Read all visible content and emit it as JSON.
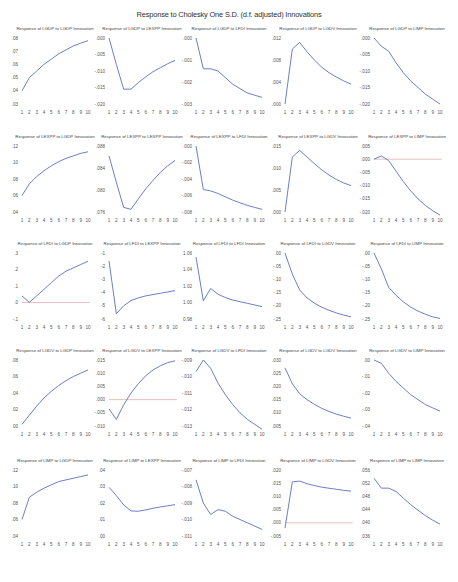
{
  "title": "Response to Cholesky One S.D. (d.f. adjusted) Innovations",
  "chart_data": [
    {
      "type": "line",
      "title": "Response of LGDP to LGDP Innovation",
      "x": [
        1,
        2,
        3,
        4,
        5,
        6,
        7,
        8,
        9,
        10
      ],
      "values": [
        0.04,
        0.05,
        0.055,
        0.06,
        0.064,
        0.068,
        0.071,
        0.074,
        0.076,
        0.078
      ],
      "yticks": [
        ".03",
        ".04",
        ".05",
        ".06",
        ".07",
        ".08"
      ],
      "ylim": [
        0.03,
        0.08
      ],
      "zero_line": false
    },
    {
      "type": "line",
      "title": "Response of LGDP to LEXPP Innovation",
      "x": [
        1,
        2,
        3,
        4,
        5,
        6,
        7,
        8,
        9,
        10
      ],
      "values": [
        0.0,
        -0.008,
        -0.0155,
        -0.0155,
        -0.0135,
        -0.0118,
        -0.0102,
        -0.009,
        -0.0078,
        -0.0068
      ],
      "yticks": [
        ".000",
        "-.005",
        "-.010",
        "-.015",
        "-.020"
      ],
      "ylim": [
        -0.02,
        0.0
      ],
      "zero_line": false
    },
    {
      "type": "line",
      "title": "Response of LGDP to LFDI Innovation",
      "x": [
        1,
        2,
        3,
        4,
        5,
        6,
        7,
        8,
        9,
        10
      ],
      "values": [
        0.0,
        -0.0014,
        -0.0014,
        -0.0015,
        -0.0018,
        -0.0021,
        -0.0023,
        -0.0025,
        -0.0026,
        -0.0027
      ],
      "yticks": [
        ".000",
        "-.001",
        "-.002",
        "-.003"
      ],
      "ylim": [
        -0.003,
        0.0
      ],
      "zero_line": false
    },
    {
      "type": "line",
      "title": "Response of LGDP to LGDV Innovation",
      "x": [
        1,
        2,
        3,
        4,
        5,
        6,
        7,
        8,
        9,
        10
      ],
      "values": [
        0.0,
        0.01,
        0.0112,
        0.0095,
        0.008,
        0.0067,
        0.0057,
        0.0049,
        0.0042,
        0.0036
      ],
      "yticks": [
        ".012",
        ".008",
        ".004",
        ".000"
      ],
      "ylim": [
        0.0,
        0.012
      ],
      "zero_line": false
    },
    {
      "type": "line",
      "title": "Response of LGDP to LIMP Innovation",
      "x": [
        1,
        2,
        3,
        4,
        5,
        6,
        7,
        8,
        9,
        10
      ],
      "values": [
        0.0,
        -0.0025,
        -0.004,
        -0.0075,
        -0.0105,
        -0.013,
        -0.015,
        -0.017,
        -0.0185,
        -0.02
      ],
      "yticks": [
        ".000",
        "-.005",
        "-.010",
        "-.015",
        "-.020"
      ],
      "ylim": [
        -0.02,
        0.0
      ],
      "zero_line": false
    },
    {
      "type": "line",
      "title": "Response of LEXPP to LGDP Innovation",
      "x": [
        1,
        2,
        3,
        4,
        5,
        6,
        7,
        8,
        9,
        10
      ],
      "values": [
        0.06,
        0.074,
        0.083,
        0.09,
        0.096,
        0.101,
        0.105,
        0.108,
        0.111,
        0.113
      ],
      "yticks": [
        ".12",
        ".10",
        ".08",
        ".06",
        ".04"
      ],
      "ylim": [
        0.04,
        0.12
      ],
      "zero_line": false
    },
    {
      "type": "line",
      "title": "Response of LEXPP to LEXPP Innovation",
      "x": [
        1,
        2,
        3,
        4,
        5,
        6,
        7,
        8,
        9,
        10
      ],
      "values": [
        0.0865,
        0.0825,
        0.0787,
        0.0784,
        0.08,
        0.0815,
        0.0828,
        0.084,
        0.085,
        0.0858
      ],
      "yticks": [
        ".088",
        ".084",
        ".080",
        ".076"
      ],
      "ylim": [
        0.078,
        0.088
      ],
      "zero_line": false
    },
    {
      "type": "line",
      "title": "Response of LEXPP to LFDI Innovation",
      "x": [
        1,
        2,
        3,
        4,
        5,
        6,
        7,
        8,
        9,
        10
      ],
      "values": [
        0.0,
        -0.0066,
        -0.0068,
        -0.0072,
        -0.0077,
        -0.0082,
        -0.0086,
        -0.009,
        -0.0093,
        -0.0096
      ],
      "yticks": [
        ".000",
        "-.002",
        "-.004",
        "-.006",
        "-.008"
      ],
      "ylim": [
        -0.01,
        0.0
      ],
      "zero_line": false
    },
    {
      "type": "line",
      "title": "Response of LEXPP to LGDV Innovation",
      "x": [
        1,
        2,
        3,
        4,
        5,
        6,
        7,
        8,
        9,
        10
      ],
      "values": [
        0.0,
        0.0125,
        0.014,
        0.0125,
        0.011,
        0.0096,
        0.0084,
        0.0074,
        0.0066,
        0.006
      ],
      "yticks": [
        ".015",
        ".010",
        ".005",
        ".000"
      ],
      "ylim": [
        0.0,
        0.015
      ],
      "zero_line": false
    },
    {
      "type": "line",
      "title": "Response of LEXPP to LIMP Innovation",
      "x": [
        1,
        2,
        3,
        4,
        5,
        6,
        7,
        8,
        9,
        10
      ],
      "values": [
        0.0,
        0.0012,
        -0.0005,
        -0.0045,
        -0.0085,
        -0.012,
        -0.015,
        -0.0175,
        -0.0195,
        -0.0212
      ],
      "yticks": [
        ".005",
        ".000",
        "-.005",
        "-.010",
        "-.015",
        "-.020"
      ],
      "ylim": [
        -0.02,
        0.005
      ],
      "zero_line": true
    },
    {
      "type": "line",
      "title": "Response of LFDI to LGDP Innovation",
      "x": [
        1,
        2,
        3,
        4,
        5,
        6,
        7,
        8,
        9,
        10
      ],
      "values": [
        0.04,
        0.001,
        0.04,
        0.08,
        0.12,
        0.16,
        0.19,
        0.21,
        0.23,
        0.25
      ],
      "yticks": [
        ".3",
        ".2",
        ".1",
        ".0",
        "-.1"
      ],
      "ylim": [
        -0.1,
        0.3
      ],
      "zero_line": true
    },
    {
      "type": "line",
      "title": "Response of LFDI to LEXPP Innovation",
      "x": [
        1,
        2,
        3,
        4,
        5,
        6,
        7,
        8,
        9,
        10
      ],
      "values": [
        -1.6,
        -5.6,
        -5.0,
        -4.6,
        -4.4,
        -4.25,
        -4.15,
        -4.05,
        -3.95,
        -3.85
      ],
      "yticks": [
        "-1",
        "-2",
        "-3",
        "-4",
        "-5",
        "-6"
      ],
      "ylim": [
        -6,
        -1
      ],
      "zero_line": false
    },
    {
      "type": "line",
      "title": "Response of LFDI to LFDI Innovation",
      "x": [
        1,
        2,
        3,
        4,
        5,
        6,
        7,
        8,
        9,
        10
      ],
      "values": [
        1.055,
        1.002,
        1.017,
        1.01,
        1.006,
        1.003,
        1.001,
        0.999,
        0.997,
        0.995
      ],
      "yticks": [
        "1.06",
        "1.04",
        "1.02",
        "1.00",
        "0.98"
      ],
      "ylim": [
        0.98,
        1.06
      ],
      "zero_line": false
    },
    {
      "type": "line",
      "title": "Response of LFDI to LGDV Innovation",
      "x": [
        1,
        2,
        3,
        4,
        5,
        6,
        7,
        8,
        9,
        10
      ],
      "values": [
        0.0,
        -0.08,
        -0.14,
        -0.17,
        -0.19,
        -0.205,
        -0.217,
        -0.227,
        -0.235,
        -0.242
      ],
      "yticks": [
        ".00",
        "-.05",
        "-.10",
        "-.15",
        "-.20",
        "-.25"
      ],
      "ylim": [
        -0.25,
        0.0
      ],
      "zero_line": false
    },
    {
      "type": "line",
      "title": "Response of LFDI to LIMP Innovation",
      "x": [
        1,
        2,
        3,
        4,
        5,
        6,
        7,
        8,
        9,
        10
      ],
      "values": [
        0.0,
        -0.06,
        -0.13,
        -0.16,
        -0.185,
        -0.205,
        -0.22,
        -0.232,
        -0.242,
        -0.248
      ],
      "yticks": [
        ".00",
        "-.05",
        "-.10",
        "-.15",
        "-.20",
        "-.25"
      ],
      "ylim": [
        -0.25,
        0.0
      ],
      "zero_line": false
    },
    {
      "type": "line",
      "title": "Response of LGDV to LGDP Innovation",
      "x": [
        1,
        2,
        3,
        4,
        5,
        6,
        7,
        8,
        9,
        10
      ],
      "values": [
        0.002,
        0.013,
        0.024,
        0.034,
        0.042,
        0.049,
        0.055,
        0.06,
        0.064,
        0.068
      ],
      "yticks": [
        ".08",
        ".06",
        ".04",
        ".02",
        ".00"
      ],
      "ylim": [
        0.0,
        0.08
      ],
      "zero_line": false
    },
    {
      "type": "line",
      "title": "Response of LGDV to LEXPP Innovation",
      "x": [
        1,
        2,
        3,
        4,
        5,
        6,
        7,
        8,
        9,
        10
      ],
      "values": [
        -0.0035,
        -0.0075,
        -0.002,
        0.0025,
        0.006,
        0.009,
        0.0112,
        0.0128,
        0.014,
        0.0147
      ],
      "yticks": [
        ".015",
        ".010",
        ".005",
        ".000",
        "-.005",
        "-.010"
      ],
      "ylim": [
        -0.01,
        0.015
      ],
      "zero_line": true
    },
    {
      "type": "line",
      "title": "Response of LGDV to LFDI Innovation",
      "x": [
        1,
        2,
        3,
        4,
        5,
        6,
        7,
        8,
        9,
        10
      ],
      "values": [
        -0.0097,
        -0.009,
        -0.0095,
        -0.0104,
        -0.0111,
        -0.0117,
        -0.0122,
        -0.0126,
        -0.0129,
        -0.0132
      ],
      "yticks": [
        "-.009",
        "-.010",
        "-.011",
        "-.012",
        "-.013"
      ],
      "ylim": [
        -0.013,
        -0.009
      ],
      "zero_line": false
    },
    {
      "type": "line",
      "title": "Response of LGDV to LGDV Innovation",
      "x": [
        1,
        2,
        3,
        4,
        5,
        6,
        7,
        8,
        9,
        10
      ],
      "values": [
        0.027,
        0.021,
        0.0172,
        0.015,
        0.0132,
        0.0117,
        0.0105,
        0.0095,
        0.0087,
        0.008
      ],
      "yticks": [
        ".030",
        ".025",
        ".020",
        ".015",
        ".010",
        ".005"
      ],
      "ylim": [
        0.005,
        0.03
      ],
      "zero_line": false
    },
    {
      "type": "line",
      "title": "Response of LGDV to LIMP Innovation",
      "x": [
        1,
        2,
        3,
        4,
        5,
        6,
        7,
        8,
        9,
        10
      ],
      "values": [
        0.0,
        -0.002,
        -0.008,
        -0.013,
        -0.017,
        -0.021,
        -0.024,
        -0.027,
        -0.029,
        -0.031
      ],
      "yticks": [
        ".00",
        "-.01",
        "-.02",
        "-.03",
        "-.04"
      ],
      "ylim": [
        -0.04,
        0.0
      ],
      "zero_line": false
    },
    {
      "type": "line",
      "title": "Response of LIMP to LGDP Innovation",
      "x": [
        1,
        2,
        3,
        4,
        5,
        6,
        7,
        8,
        9,
        10
      ],
      "values": [
        0.06,
        0.087,
        0.093,
        0.098,
        0.102,
        0.106,
        0.108,
        0.11,
        0.112,
        0.114
      ],
      "yticks": [
        ".12",
        ".10",
        ".08",
        ".06",
        ".04"
      ],
      "ylim": [
        0.04,
        0.12
      ],
      "zero_line": false
    },
    {
      "type": "line",
      "title": "Response of LIMP to LEXPP Innovation",
      "x": [
        1,
        2,
        3,
        4,
        5,
        6,
        7,
        8,
        9,
        10
      ],
      "values": [
        0.0295,
        0.0245,
        0.0188,
        0.0152,
        0.015,
        0.0158,
        0.0168,
        0.0176,
        0.0183,
        0.019
      ],
      "yticks": [
        ".04",
        ".03",
        ".02",
        ".01",
        ".00"
      ],
      "ylim": [
        0.0,
        0.04
      ],
      "zero_line": false
    },
    {
      "type": "line",
      "title": "Response of LIMP to LFDI Innovation",
      "x": [
        1,
        2,
        3,
        4,
        5,
        6,
        7,
        8,
        9,
        10
      ],
      "values": [
        -0.0076,
        -0.009,
        -0.0097,
        -0.0094,
        -0.0095,
        -0.0098,
        -0.01,
        -0.0102,
        -0.0104,
        -0.0106
      ],
      "yticks": [
        "-.007",
        "-.008",
        "-.009",
        "-.010",
        "-.011"
      ],
      "ylim": [
        -0.011,
        -0.007
      ],
      "zero_line": false
    },
    {
      "type": "line",
      "title": "Response of LIMP to LGDV Innovation",
      "x": [
        1,
        2,
        3,
        4,
        5,
        6,
        7,
        8,
        9,
        10
      ],
      "values": [
        -0.002,
        0.0155,
        0.0158,
        0.0148,
        0.0141,
        0.0135,
        0.0131,
        0.0127,
        0.0123,
        0.012
      ],
      "yticks": [
        ".020",
        ".015",
        ".010",
        ".005",
        ".000",
        "-.005"
      ],
      "ylim": [
        -0.005,
        0.02
      ],
      "zero_line": true
    },
    {
      "type": "line",
      "title": "Response of LIMP to LIMP Innovation",
      "x": [
        1,
        2,
        3,
        4,
        5,
        6,
        7,
        8,
        9,
        10
      ],
      "values": [
        0.0535,
        0.0505,
        0.0505,
        0.0495,
        0.0475,
        0.0455,
        0.0438,
        0.0422,
        0.0408,
        0.0396
      ],
      "yticks": [
        ".056",
        ".052",
        ".048",
        ".044",
        ".040",
        ".036"
      ],
      "ylim": [
        0.036,
        0.056
      ],
      "zero_line": false
    }
  ],
  "colors": {
    "series": "#5b6fbf",
    "zero_line": "#e0a8a8",
    "text": "#444444"
  }
}
